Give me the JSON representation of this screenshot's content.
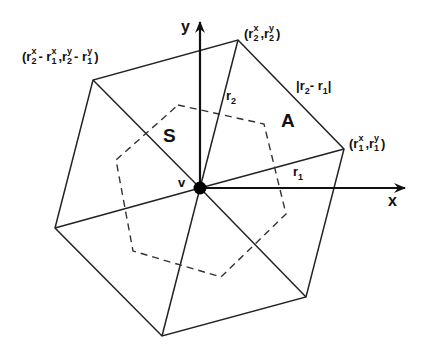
{
  "figure": {
    "type": "diagram",
    "colors": {
      "line": "#222222",
      "dashed": "#333333",
      "background": "#ffffff",
      "vertex": "#000000"
    }
  },
  "geometry": {
    "center": [
      200,
      188
    ],
    "outer_hexagon": [
      [
        238,
        40
      ],
      [
        344,
        149
      ],
      [
        306,
        297
      ],
      [
        162,
        336
      ],
      [
        55,
        228
      ],
      [
        93,
        80
      ]
    ],
    "dual_cell": [
      [
        178,
        105
      ],
      [
        264,
        124
      ],
      [
        286,
        214
      ],
      [
        221,
        277
      ],
      [
        133,
        251
      ],
      [
        116,
        160
      ]
    ],
    "x_axis_end": [
      405,
      188
    ],
    "y_axis_end": [
      200,
      22
    ]
  },
  "labels": {
    "x_axis": "x",
    "y_axis": "y",
    "vertex": "v",
    "region_s": "S",
    "region_a": "A",
    "r1": {
      "base": "r",
      "sub": "1"
    },
    "r2": {
      "base": "r",
      "sub": "2"
    },
    "edge_length": {
      "text": "|r2 - r1|",
      "base1": "r",
      "sub1": "2",
      "sep": "- ",
      "base2": "r",
      "sub2": "1"
    },
    "point_r1": {
      "text": "(r1x, r1y)",
      "base": "r",
      "sub": "1",
      "supx": "x",
      "supy": "y"
    },
    "point_r2": {
      "text": "(r2x, r2y)",
      "base": "r",
      "sub": "2",
      "supx": "x",
      "supy": "y"
    },
    "point_diff": {
      "text": "(r2x - r1x, r2y - r1y)",
      "sub1": "2",
      "sub2": "1",
      "supx": "x",
      "supy": "y"
    }
  }
}
